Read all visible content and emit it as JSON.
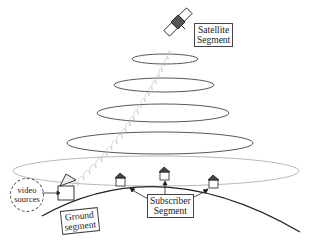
{
  "diagram": {
    "labels": {
      "satellite_segment": [
        "Satellite",
        "Segment"
      ],
      "ground_segment": [
        "Ground",
        "segment"
      ],
      "subscriber_segment": [
        "Subscriber",
        "Segment"
      ],
      "video_sources": [
        "video",
        "sources"
      ]
    },
    "nodes": [
      {
        "id": "satellite",
        "type": "satellite",
        "x": 178,
        "y": 22
      },
      {
        "id": "ground-station",
        "type": "dish",
        "x": 68,
        "y": 188
      },
      {
        "id": "house-1",
        "type": "house",
        "x": 121,
        "y": 180
      },
      {
        "id": "house-2",
        "type": "house",
        "x": 165,
        "y": 172
      },
      {
        "id": "house-3",
        "type": "house",
        "x": 214,
        "y": 181
      }
    ],
    "beam_ellipses": [
      {
        "cx": 165,
        "cy": 59,
        "rx": 33,
        "ry": 5
      },
      {
        "cx": 164,
        "cy": 85,
        "rx": 50,
        "ry": 7
      },
      {
        "cx": 163,
        "cy": 113,
        "rx": 66,
        "ry": 9
      },
      {
        "cx": 160,
        "cy": 143,
        "rx": 93,
        "ry": 11
      },
      {
        "cx": 156,
        "cy": 171,
        "rx": 143,
        "ry": 15
      }
    ],
    "colors": {
      "line": "#333333",
      "faint": "#aaaaaa",
      "text": "#222222"
    }
  }
}
